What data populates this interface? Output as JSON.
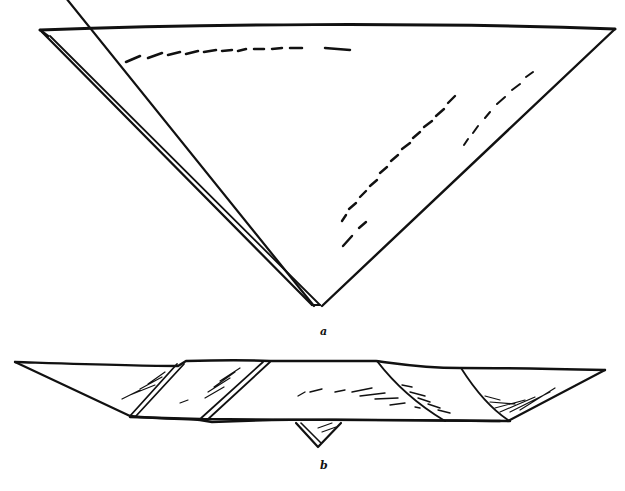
{
  "figure": {
    "ink_color": "#111111",
    "background": "#ffffff",
    "labels": {
      "a": "a",
      "b": "b"
    }
  }
}
